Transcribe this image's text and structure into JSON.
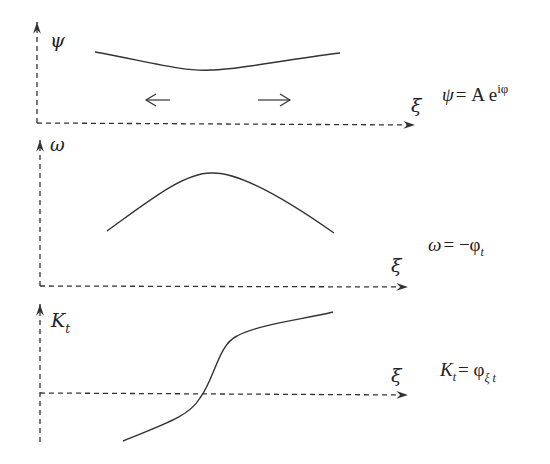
{
  "panels": [
    {
      "id": "psi",
      "ylabel": "ψ",
      "xlabel": "ξ",
      "equation": {
        "lhs": "ψ",
        "rhs_a": "= A e",
        "sup": "iφ"
      },
      "arrows": [
        "left",
        "right"
      ],
      "curve_desc": "shallow U-shaped envelope"
    },
    {
      "id": "omega",
      "ylabel": "ω",
      "xlabel": "ξ",
      "equation": {
        "lhs": "ω",
        "rhs_a": "= −φ",
        "sub": "t"
      },
      "curve_desc": "single hump (peak)"
    },
    {
      "id": "Kt",
      "ylabel": "K",
      "ylabel_sub": "t",
      "xlabel": "ξ",
      "equation": {
        "lhs": "K",
        "lhs_sub": "t",
        "rhs_a": "= φ",
        "sub": "ξ t"
      },
      "curve_desc": "monotonic S-shaped curve crossing zero"
    }
  ]
}
